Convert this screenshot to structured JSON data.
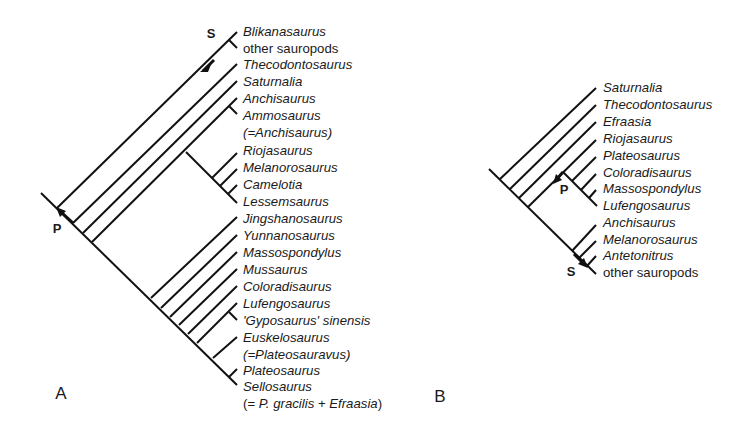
{
  "panels": [
    {
      "id": "A",
      "label": "A",
      "node_labels": {
        "S": "S",
        "P": "P"
      },
      "taxa": [
        {
          "name": "Blikanasaurus",
          "italic": true
        },
        {
          "name": "other sauropods",
          "italic": false
        },
        {
          "name": "Thecodontosaurus",
          "italic": true
        },
        {
          "name": "Saturnalia",
          "italic": true
        },
        {
          "name": "Anchisaurus",
          "italic": true
        },
        {
          "name": "Ammosaurus",
          "italic": true
        },
        {
          "name": "(=Anchisaurus)",
          "italic": true
        },
        {
          "name": "Riojasaurus",
          "italic": true
        },
        {
          "name": "Melanorosaurus",
          "italic": true
        },
        {
          "name": "Camelotia",
          "italic": true
        },
        {
          "name": "Lessemsaurus",
          "italic": true
        },
        {
          "name": "Jingshanosaurus",
          "italic": true
        },
        {
          "name": "Yunnanosaurus",
          "italic": true
        },
        {
          "name": "Massospondylus",
          "italic": true
        },
        {
          "name": "Mussaurus",
          "italic": true
        },
        {
          "name": "Coloradisaurus",
          "italic": true
        },
        {
          "name": "Lufengosaurus",
          "italic": true
        },
        {
          "name": "'Gyposaurus' sinensis",
          "italic": true
        },
        {
          "name": "Euskelosaurus",
          "italic": true
        },
        {
          "name": "(=Plateosauravus)",
          "italic": true
        },
        {
          "name": "Plateosaurus",
          "italic": true
        },
        {
          "name": "Sellosaurus",
          "italic": true
        }
      ],
      "sellosaurus_note": {
        "prefix": "(= ",
        "part1": "P. gracilis",
        "mid": " + ",
        "part2": "Efraasia",
        "suffix": ")"
      }
    },
    {
      "id": "B",
      "label": "B",
      "node_labels": {
        "S": "S",
        "P": "P"
      },
      "taxa": [
        {
          "name": "Saturnalia",
          "italic": true
        },
        {
          "name": "Thecodontosaurus",
          "italic": true
        },
        {
          "name": "Efraasia",
          "italic": true
        },
        {
          "name": "Riojasaurus",
          "italic": true
        },
        {
          "name": "Plateosaurus",
          "italic": true
        },
        {
          "name": "Coloradisaurus",
          "italic": true
        },
        {
          "name": "Massospondylus",
          "italic": true
        },
        {
          "name": "Lufengosaurus",
          "italic": true
        },
        {
          "name": "Anchisaurus",
          "italic": true
        },
        {
          "name": "Melanorosaurus",
          "italic": true
        },
        {
          "name": "Antetonitrus",
          "italic": true
        },
        {
          "name": "other sauropods",
          "italic": false
        }
      ]
    }
  ],
  "colors": {
    "line": "#111111",
    "text": "#1a1a1a",
    "background": "#ffffff"
  }
}
